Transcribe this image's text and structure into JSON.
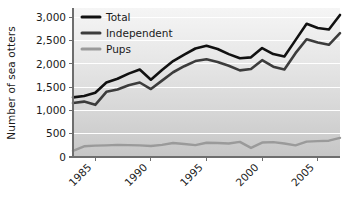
{
  "chart_data": {
    "type": "line",
    "title": "",
    "xlabel": "",
    "ylabel": "Number of sea otters",
    "ylim": [
      0,
      3200
    ],
    "xlim": [
      1983,
      2007
    ],
    "grid": true,
    "legend_position": "top-left",
    "x": [
      1983,
      1984,
      1985,
      1986,
      1987,
      1988,
      1989,
      1990,
      1991,
      1992,
      1993,
      1994,
      1995,
      1996,
      1997,
      1998,
      1999,
      2000,
      2001,
      2002,
      2003,
      2004,
      2005,
      2006,
      2007
    ],
    "y_ticks": [
      0,
      500,
      1000,
      1500,
      2000,
      2500,
      3000
    ],
    "y_tick_labels": [
      "0",
      "500",
      "1,000",
      "1,500",
      "2,000",
      "2,500",
      "3,000"
    ],
    "x_ticks": [
      1985,
      1990,
      1995,
      2000,
      2005
    ],
    "x_tick_labels": [
      "1985",
      "1990",
      "1995",
      "2000",
      "2005"
    ],
    "series": [
      {
        "name": "Total",
        "color": "#111111",
        "values": [
          1280,
          1310,
          1380,
          1600,
          1680,
          1790,
          1880,
          1660,
          1870,
          2060,
          2200,
          2330,
          2390,
          2320,
          2210,
          2120,
          2140,
          2340,
          2210,
          2160,
          2510,
          2860,
          2770,
          2740,
          3050
        ]
      },
      {
        "name": "Independent",
        "color": "#3c3c3c",
        "values": [
          1160,
          1190,
          1120,
          1400,
          1450,
          1540,
          1600,
          1460,
          1640,
          1820,
          1950,
          2060,
          2100,
          2040,
          1960,
          1860,
          1890,
          2080,
          1940,
          1880,
          2230,
          2530,
          2460,
          2410,
          2660
        ]
      },
      {
        "name": "Pups",
        "color": "#9a9a9a",
        "values": [
          130,
          230,
          245,
          250,
          260,
          255,
          250,
          235,
          260,
          300,
          280,
          255,
          305,
          300,
          290,
          325,
          195,
          310,
          320,
          290,
          250,
          330,
          340,
          350,
          410
        ]
      }
    ]
  },
  "legend": {
    "items": [
      {
        "label": "Total"
      },
      {
        "label": "Independent"
      },
      {
        "label": "Pups"
      }
    ]
  },
  "colors": {
    "total": "#111111",
    "independent": "#3c3c3c",
    "pups": "#9a9a9a",
    "plot_bg_top": "#f2f2f2",
    "plot_bg_bottom": "#c9c9c9",
    "gridline": "#ffffff",
    "axis": "#6e6e6e"
  }
}
